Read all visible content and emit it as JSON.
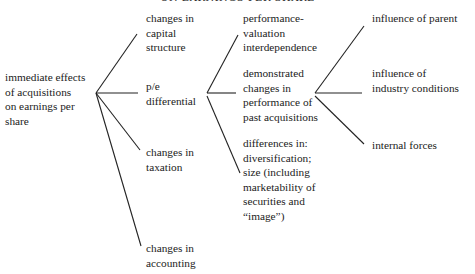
{
  "title": "ON EARNINGS PER SHARE",
  "root": {
    "label": "immediate effects\nof acquisitions\non earnings per\nshare"
  },
  "level1": [
    {
      "label": "changes in\ncapital\nstructure"
    },
    {
      "label": "p/e\ndifferential"
    },
    {
      "label": "changes in\ntaxation"
    },
    {
      "label": "changes in\naccounting"
    }
  ],
  "level2": [
    {
      "label": "performance-\nvaluation\ninterdependence"
    },
    {
      "label": "demonstrated\nchanges in\nperformance of\npast acquisitions"
    },
    {
      "label": "differences in:\ndiversification;\nsize (including\nmarketability of\nsecurities and\n“image”)"
    }
  ],
  "level3": [
    {
      "label": "influence of parent"
    },
    {
      "label": "influence of\nindustry conditions"
    },
    {
      "label": "internal forces"
    }
  ]
}
